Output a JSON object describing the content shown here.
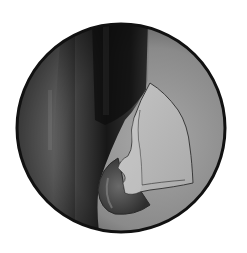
{
  "image": {
    "description": "Grayscale circular endoscopic/arthroscopic view illustration",
    "subject": "scope-view",
    "colors": {
      "background": "#ffffff",
      "rim": "#111111",
      "field_light": "#9a9a9a",
      "field_dark": "#1a1a1a",
      "tissue_flap": "#b8b8b8",
      "tissue_outline": "#3a3a3a",
      "rounded_structure": "#555555"
    },
    "elements": [
      {
        "name": "circular-scope-frame"
      },
      {
        "name": "dark-vertical-shadow"
      },
      {
        "name": "light-tissue-flap"
      },
      {
        "name": "rounded-structure"
      }
    ]
  }
}
